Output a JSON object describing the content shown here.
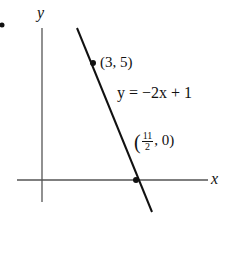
{
  "diagram": {
    "type": "coordinate-graph",
    "axes": {
      "x_label": "x",
      "y_label": "y"
    },
    "line": {
      "equation_label": "y = −2x + 11",
      "equation_visible": "y = −2x + 1",
      "slope": -2,
      "intercept": 11
    },
    "points": [
      {
        "label": "(3, 5)",
        "x": 3,
        "y": 5
      },
      {
        "label_open": "(",
        "label_num": "11",
        "label_den": "2",
        "label_rest": ", 0)",
        "x": 5.5,
        "y": 0
      }
    ],
    "stroke_color": "#111111",
    "axis_color": "#555555"
  }
}
